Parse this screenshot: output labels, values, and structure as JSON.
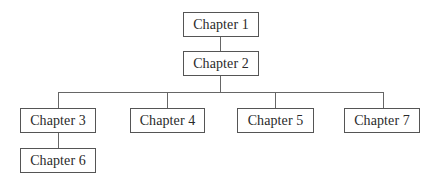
{
  "diagram": {
    "type": "tree",
    "colors": {
      "line": "#666666",
      "border": "#555555",
      "text": "#2a2a2a",
      "background": "#ffffff"
    },
    "nodes": [
      {
        "id": "ch1",
        "label": "Chapter 1"
      },
      {
        "id": "ch2",
        "label": "Chapter 2"
      },
      {
        "id": "ch3",
        "label": "Chapter 3"
      },
      {
        "id": "ch4",
        "label": "Chapter 4"
      },
      {
        "id": "ch5",
        "label": "Chapter 5"
      },
      {
        "id": "ch7",
        "label": "Chapter 7"
      },
      {
        "id": "ch6",
        "label": "Chapter 6"
      }
    ],
    "edges": [
      {
        "from": "Chapter 1",
        "to": "Chapter 2"
      },
      {
        "from": "Chapter 2",
        "to": "Chapter 3"
      },
      {
        "from": "Chapter 2",
        "to": "Chapter 4"
      },
      {
        "from": "Chapter 2",
        "to": "Chapter 5"
      },
      {
        "from": "Chapter 2",
        "to": "Chapter 7"
      },
      {
        "from": "Chapter 3",
        "to": "Chapter 6"
      }
    ]
  }
}
